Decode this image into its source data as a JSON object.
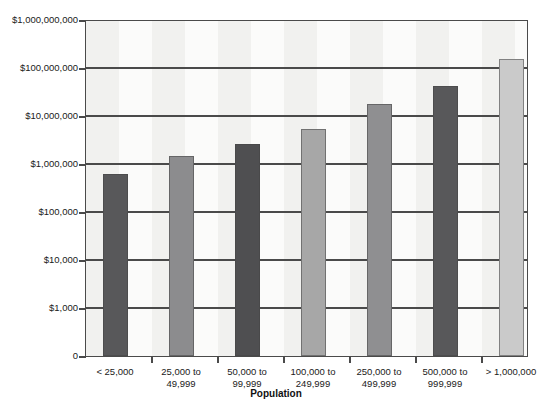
{
  "chart_data": {
    "type": "bar",
    "title": "",
    "xlabel": "Population",
    "ylabel": "",
    "yscale": "log",
    "grid": true,
    "legend": "none",
    "categories": [
      "< 25,000",
      "25,000 to 49,999",
      "50,000 to 99,999",
      "100,000 to 249,999",
      "250,000 to 499,999",
      "500,000 to 999,999",
      "> 1,000,000"
    ],
    "category_lines": [
      [
        "< 25,000",
        ""
      ],
      [
        "25,000 to",
        "49,999"
      ],
      [
        "50,000 to",
        "99,999"
      ],
      [
        "100,000 to",
        "249,999"
      ],
      [
        "250,000 to",
        "499,999"
      ],
      [
        "500,000 to",
        "999,999"
      ],
      [
        "> 1,000,000",
        ""
      ]
    ],
    "values": [
      600000,
      1400000,
      2500000,
      5200000,
      17000000,
      40000000,
      150000000
    ],
    "bar_colors": [
      "#58585a",
      "#8c8c8e",
      "#4f4f51",
      "#a7a7a7",
      "#8f8f91",
      "#58585a",
      "#cacaca"
    ],
    "ytick_labels": [
      "$1,000,000,000",
      "$100,000,000",
      "$10,000,000",
      "$1,000,000",
      "$100,000",
      "$10,000",
      "$1,000",
      "0"
    ],
    "ytick_values": [
      1000000000,
      100000000,
      10000000,
      1000000,
      100000,
      10000,
      1000,
      0
    ],
    "ylim": [
      0,
      1000000000
    ],
    "colors": {
      "axis": "#4a4a4a",
      "plot_background": "#f1f1ef",
      "band": "#fbfbfa",
      "text": "#1a1a1a"
    }
  }
}
